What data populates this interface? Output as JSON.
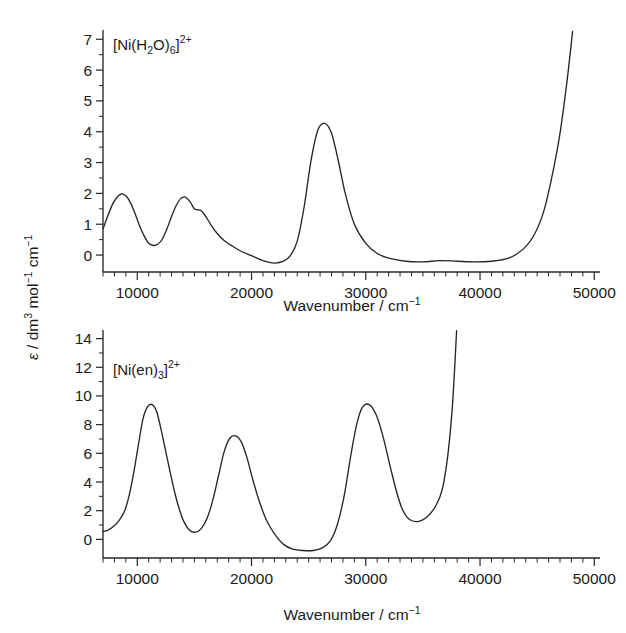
{
  "figure": {
    "background": "#ffffff",
    "line_color": "#262626",
    "text_color": "#1a1a1a"
  },
  "chart_data": [
    {
      "type": "line",
      "panel": "top",
      "title": "",
      "annotation": "[Ni(H2O)6]2+",
      "annotation_parts": {
        "prefix": "[Ni(H",
        "sub1": "2",
        "mid": "O)",
        "sub2": "6",
        "close": "]",
        "sup": "2+"
      },
      "xlabel": "Wavenumber / cm",
      "xlabel_sup": "−1",
      "ylabel": "ε / dm",
      "ylabel_full": "ε / dm3 mol−1 cm−1",
      "xlim": [
        7000,
        50500
      ],
      "ylim": [
        -0.55,
        7.3
      ],
      "xticks": [
        10000,
        20000,
        30000,
        40000,
        50000
      ],
      "xticklabels": [
        "10000",
        "20000",
        "30000",
        "40000",
        "50000"
      ],
      "xtick_minor_step": 1000,
      "yticks": [
        0,
        1,
        2,
        3,
        4,
        5,
        6,
        7
      ],
      "yticklabels": [
        "0",
        "1",
        "2",
        "3",
        "4",
        "5",
        "6",
        "7"
      ],
      "ytick_minor_step": 0.5,
      "grid": false,
      "legend": "none",
      "x": [
        7000,
        7400,
        7800,
        8200,
        8600,
        9000,
        9400,
        9800,
        10200,
        10600,
        11000,
        11400,
        11800,
        12200,
        12600,
        13000,
        13400,
        13800,
        14200,
        14600,
        15000,
        15300,
        15600,
        16000,
        16500,
        17000,
        17600,
        18200,
        19000,
        20000,
        21000,
        22000,
        22800,
        23400,
        24000,
        24600,
        25200,
        25800,
        26400,
        27000,
        27600,
        28200,
        29000,
        30000,
        31000,
        32000,
        33500,
        35000,
        36500,
        38000,
        39500,
        41000,
        42500,
        43800,
        44800,
        45600,
        46300,
        47000,
        47600,
        48100
      ],
      "y": [
        0.85,
        1.25,
        1.62,
        1.86,
        1.98,
        1.92,
        1.7,
        1.35,
        0.95,
        0.62,
        0.38,
        0.31,
        0.35,
        0.52,
        0.85,
        1.25,
        1.6,
        1.83,
        1.88,
        1.74,
        1.5,
        1.47,
        1.44,
        1.25,
        0.95,
        0.7,
        0.47,
        0.32,
        0.14,
        -0.02,
        -0.18,
        -0.26,
        -0.2,
        -0.02,
        0.45,
        1.55,
        3.05,
        4.05,
        4.27,
        3.95,
        3.05,
        2.0,
        1.0,
        0.38,
        0.05,
        -0.1,
        -0.2,
        -0.22,
        -0.18,
        -0.2,
        -0.22,
        -0.2,
        -0.1,
        0.2,
        0.7,
        1.45,
        2.55,
        3.95,
        5.6,
        7.25
      ]
    },
    {
      "type": "line",
      "panel": "bottom",
      "title": "",
      "annotation": "[Ni(en)3]2+",
      "annotation_parts": {
        "prefix": "[Ni(en)",
        "sub1": "3",
        "close": "]",
        "sup": "2+"
      },
      "xlabel": "Wavenumber / cm",
      "xlabel_sup": "−1",
      "ylabel_full": "ε / dm3 mol−1 cm−1",
      "xlim": [
        7000,
        50500
      ],
      "ylim": [
        -1.3,
        14.6
      ],
      "xticks": [
        10000,
        20000,
        30000,
        40000,
        50000
      ],
      "xticklabels": [
        "10000",
        "20000",
        "30000",
        "40000",
        "50000"
      ],
      "xtick_minor_step": 1000,
      "yticks": [
        0,
        2,
        4,
        6,
        8,
        10,
        12,
        14
      ],
      "yticklabels": [
        "0",
        "2",
        "4",
        "6",
        "8",
        "10",
        "12",
        "14"
      ],
      "ytick_minor_step": 1,
      "grid": false,
      "legend": "none",
      "x": [
        7000,
        7400,
        7900,
        8400,
        8900,
        9300,
        9700,
        10100,
        10500,
        10900,
        11300,
        11700,
        12100,
        12500,
        12900,
        13300,
        13700,
        14100,
        14600,
        15100,
        15600,
        16100,
        16600,
        17100,
        17600,
        18100,
        18600,
        19100,
        19600,
        20100,
        20700,
        21300,
        22000,
        22800,
        23600,
        24500,
        25400,
        26200,
        26900,
        27500,
        28100,
        28700,
        29200,
        29700,
        30300,
        30900,
        31500,
        32100,
        32700,
        33200,
        33800,
        34600,
        35400,
        36100,
        36700,
        37200,
        37600,
        37950
      ],
      "y": [
        0.55,
        0.62,
        0.9,
        1.3,
        2.0,
        3.1,
        4.7,
        6.6,
        8.4,
        9.25,
        9.4,
        8.9,
        7.6,
        6.1,
        4.6,
        3.2,
        2.05,
        1.2,
        0.62,
        0.5,
        0.75,
        1.45,
        2.7,
        4.4,
        6.1,
        7.05,
        7.22,
        6.8,
        5.7,
        4.2,
        2.6,
        1.35,
        0.4,
        -0.35,
        -0.68,
        -0.78,
        -0.78,
        -0.6,
        -0.1,
        1.0,
        3.0,
        5.9,
        8.0,
        9.2,
        9.4,
        8.7,
        7.2,
        5.2,
        3.3,
        2.1,
        1.4,
        1.25,
        1.6,
        2.3,
        3.5,
        6.0,
        9.5,
        14.55
      ]
    }
  ],
  "axis_titles": {
    "x": "Wavenumber / cm",
    "x_sup": "−1",
    "y_eps": "ε",
    "y_slash": " / dm",
    "y_sup3": "3",
    "y_mol": " mol",
    "y_sup_m1a": "−1",
    "y_cm": " cm",
    "y_sup_m1b": "−1"
  }
}
